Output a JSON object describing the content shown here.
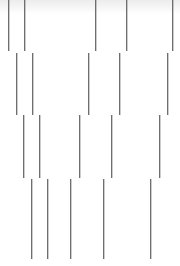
{
  "graphic": {
    "line_color": "#6e6e6e",
    "rows": [
      {
        "top": 0,
        "bottom": 51,
        "xs": [
          8,
          24,
          95,
          126,
          172
        ]
      },
      {
        "top": 53,
        "bottom": 115,
        "xs": [
          16,
          32,
          88,
          119,
          167
        ]
      },
      {
        "top": 115,
        "bottom": 178,
        "xs": [
          23,
          39,
          79,
          111,
          159
        ]
      },
      {
        "top": 179,
        "bottom": 259,
        "xs": [
          31,
          47,
          70,
          103,
          150
        ]
      }
    ]
  }
}
